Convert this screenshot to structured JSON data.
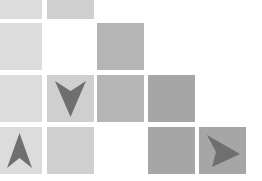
{
  "board": {
    "tile_size": 47,
    "col_x": [
      -4,
      47,
      97,
      148,
      199
    ],
    "row_y": [
      -28,
      23,
      75,
      127
    ],
    "colors": {
      "light": "#dcdcdc",
      "light_mid": "#cfcfcf",
      "mid": "#b5b5b5",
      "dark": "#a6a6a6",
      "arrow": "#6f6f6f"
    },
    "tiles": [
      {
        "row": 0,
        "col": 0,
        "shade": "light",
        "arrow": null
      },
      {
        "row": 0,
        "col": 1,
        "shade": "light_mid",
        "arrow": null
      },
      {
        "row": 1,
        "col": 0,
        "shade": "light",
        "arrow": null
      },
      {
        "row": 1,
        "col": 2,
        "shade": "mid",
        "arrow": null
      },
      {
        "row": 2,
        "col": 0,
        "shade": "light",
        "arrow": null
      },
      {
        "row": 2,
        "col": 1,
        "shade": "light_mid",
        "arrow": "down"
      },
      {
        "row": 2,
        "col": 2,
        "shade": "mid",
        "arrow": null
      },
      {
        "row": 2,
        "col": 3,
        "shade": "dark",
        "arrow": null
      },
      {
        "row": 3,
        "col": 0,
        "shade": "light",
        "arrow": "up"
      },
      {
        "row": 3,
        "col": 1,
        "shade": "light_mid",
        "arrow": null
      },
      {
        "row": 3,
        "col": 3,
        "shade": "dark",
        "arrow": null
      },
      {
        "row": 3,
        "col": 4,
        "shade": "dark",
        "arrow": "right"
      }
    ]
  }
}
